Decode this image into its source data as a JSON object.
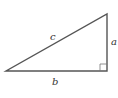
{
  "diagram": {
    "type": "right-triangle",
    "labels": {
      "hypotenuse": "c",
      "vertical_leg": "a",
      "horizontal_leg": "b"
    },
    "right_angle_marker": true,
    "stroke_color": "#555555"
  }
}
